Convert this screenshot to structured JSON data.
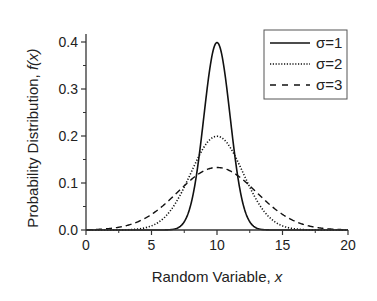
{
  "chart_data": {
    "type": "line",
    "title": "",
    "xlabel": "Random Variable, x",
    "xlabel_parts": {
      "text": "Random Variable, ",
      "var": "x"
    },
    "ylabel": "Probability Distribution, f(x)",
    "ylabel_parts": {
      "text": "Probability Distribution, ",
      "var": "f(x)"
    },
    "xlim": [
      0,
      20
    ],
    "ylim": [
      0.0,
      0.4
    ],
    "xticks": [
      0,
      5,
      10,
      15,
      20
    ],
    "xtick_labels": [
      "0",
      "5",
      "10",
      "15",
      "20"
    ],
    "yticks": [
      0.0,
      0.1,
      0.2,
      0.3,
      0.4
    ],
    "ytick_labels": [
      "0.0",
      "0.1",
      "0.2",
      "0.3",
      "0.4"
    ],
    "grid": false,
    "legend_position": "upper right",
    "distribution": "normal",
    "mean": 10,
    "series": [
      {
        "name": "σ=1",
        "sigma": 1,
        "style": "solid",
        "peak": 0.399,
        "x": [
          0,
          5,
          6,
          7,
          7.5,
          8,
          8.5,
          9,
          9.5,
          10,
          10.5,
          11,
          11.5,
          12,
          12.5,
          13,
          14,
          15,
          20
        ],
        "values": [
          0.0,
          0.0,
          0.0001,
          0.0044,
          0.0175,
          0.054,
          0.1295,
          0.242,
          0.352,
          0.399,
          0.352,
          0.242,
          0.1295,
          0.054,
          0.0175,
          0.0044,
          0.0001,
          0.0,
          0.0
        ]
      },
      {
        "name": "σ=2",
        "sigma": 2,
        "style": "dotted",
        "peak": 0.199,
        "x": [
          0,
          2,
          4,
          5,
          6,
          7,
          8,
          9,
          10,
          11,
          12,
          13,
          14,
          15,
          16,
          18,
          20
        ],
        "values": [
          0.0,
          0.0001,
          0.0022,
          0.0088,
          0.027,
          0.0648,
          0.121,
          0.176,
          0.199,
          0.176,
          0.121,
          0.0648,
          0.027,
          0.0088,
          0.0022,
          0.0001,
          0.0
        ]
      },
      {
        "name": "σ=3",
        "sigma": 3,
        "style": "dashed",
        "peak": 0.133,
        "x": [
          0,
          2,
          4,
          5,
          6,
          7,
          8,
          9,
          10,
          11,
          12,
          13,
          14,
          15,
          16,
          18,
          20
        ],
        "values": [
          0.0005,
          0.0038,
          0.018,
          0.033,
          0.055,
          0.0807,
          0.1065,
          0.1258,
          0.133,
          0.1258,
          0.1065,
          0.0807,
          0.055,
          0.033,
          0.018,
          0.0038,
          0.0005
        ]
      }
    ]
  },
  "colors": {
    "line": "#111111",
    "axis": "#333333",
    "text": "#222222",
    "background": "#ffffff"
  }
}
